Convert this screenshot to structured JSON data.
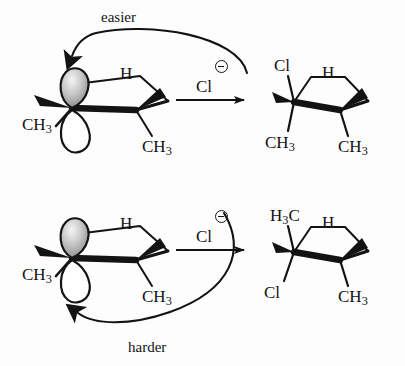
{
  "figure": {
    "background_color": "#fdfdfd",
    "ink_color": "#131313"
  },
  "annotations": {
    "top_pathway": "easier",
    "bottom_pathway": "harder"
  },
  "nucleophile": {
    "symbol": "Cl",
    "charge_glyph": "circled-minus",
    "charge_sign": "⊖",
    "name": "chloride-ion"
  },
  "reactions": [
    {
      "id": "top",
      "pathway_label": "easier",
      "reactant": {
        "name": "cyclopentyl-carbocation",
        "labels": [
          {
            "id": "h-top",
            "text": "H"
          },
          {
            "id": "ch3-left",
            "text": "CH",
            "subscript": "3"
          },
          {
            "id": "ch3-right",
            "text": "CH",
            "subscript": "3"
          }
        ],
        "orbital": {
          "name": "p-orbital",
          "top_lobe_fill": "shaded",
          "bottom_lobe_fill": "white"
        }
      },
      "reagent": {
        "symbol": "Cl",
        "charge_sign": "⊖"
      },
      "product": {
        "name": "cis-chlorocyclopentane-product",
        "labels": [
          {
            "id": "cl-upper-left",
            "text": "Cl"
          },
          {
            "id": "h-upper-right",
            "text": "H"
          },
          {
            "id": "ch3-lower-left",
            "text": "CH",
            "subscript": "3"
          },
          {
            "id": "ch3-lower-right",
            "text": "CH",
            "subscript": "3"
          }
        ]
      }
    },
    {
      "id": "bottom",
      "pathway_label": "harder",
      "reactant": {
        "name": "cyclopentyl-carbocation",
        "labels": [
          {
            "id": "h-top",
            "text": "H"
          },
          {
            "id": "ch3-left",
            "text": "CH",
            "subscript": "3"
          },
          {
            "id": "ch3-right",
            "text": "CH",
            "subscript": "3"
          }
        ],
        "orbital": {
          "name": "p-orbital",
          "top_lobe_fill": "shaded",
          "bottom_lobe_fill": "white"
        }
      },
      "reagent": {
        "symbol": "Cl",
        "charge_sign": "⊖"
      },
      "product": {
        "name": "trans-chlorocyclopentane-product",
        "labels": [
          {
            "id": "h3c-upper-left",
            "text": "H",
            "subscript_lead": "3",
            "tail": "C"
          },
          {
            "id": "h-upper-right",
            "text": "H"
          },
          {
            "id": "cl-lower-left",
            "text": "Cl"
          },
          {
            "id": "ch3-lower-right",
            "text": "CH",
            "subscript": "3"
          }
        ]
      }
    }
  ]
}
